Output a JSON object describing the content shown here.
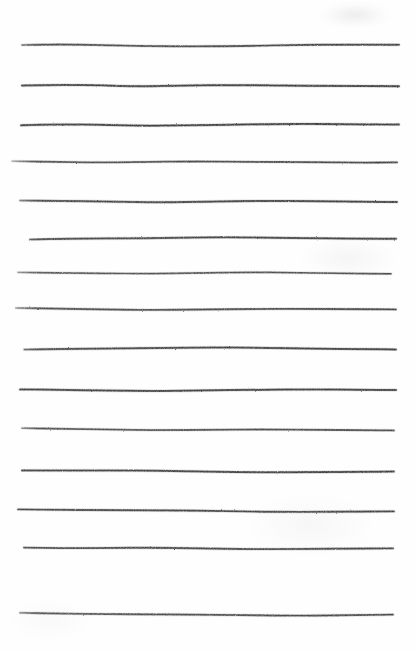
{
  "document": {
    "kind": "scanned-ruled-paper",
    "width": 417,
    "height": 650,
    "background_color": "#fefefe",
    "ink_color": "#3c3c3c",
    "ink_color_light": "#6b6b6b",
    "line_count": 15,
    "text_content": ""
  },
  "chart_data": {
    "type": "line",
    "title": "",
    "subtitle": "",
    "xlabel": "",
    "ylabel": "",
    "grid": false,
    "legend": null,
    "xlim": [
      0,
      417
    ],
    "ylim": [
      0,
      650
    ],
    "series": [
      {
        "name": "rule-1",
        "y": 45,
        "x_start": 22,
        "x_end": 399,
        "stroke_width": 1.9,
        "opacity": 0.92,
        "fade_start": true,
        "points": [
          [
            22,
            45
          ],
          [
            60,
            44.4
          ],
          [
            100,
            45.0
          ],
          [
            150,
            46.2
          ],
          [
            200,
            46.4
          ],
          [
            250,
            46.0
          ],
          [
            300,
            44.8
          ],
          [
            350,
            44.6
          ],
          [
            399,
            44.8
          ]
        ]
      },
      {
        "name": "rule-2",
        "y": 85,
        "x_start": 22,
        "x_end": 399,
        "stroke_width": 2.0,
        "opacity": 0.95,
        "fade_start": false,
        "points": [
          [
            22,
            85.6
          ],
          [
            60,
            84.8
          ],
          [
            100,
            85.4
          ],
          [
            140,
            86.4
          ],
          [
            180,
            85.6
          ],
          [
            230,
            85.0
          ],
          [
            280,
            85.6
          ],
          [
            330,
            86.0
          ],
          [
            399,
            86.2
          ]
        ]
      },
      {
        "name": "rule-3",
        "y": 124,
        "x_start": 21,
        "x_end": 399,
        "stroke_width": 2.0,
        "opacity": 0.95,
        "fade_start": false,
        "points": [
          [
            21,
            125.2
          ],
          [
            60,
            124.4
          ],
          [
            100,
            124.8
          ],
          [
            140,
            125.8
          ],
          [
            190,
            125.4
          ],
          [
            240,
            124.6
          ],
          [
            290,
            123.8
          ],
          [
            340,
            124.2
          ],
          [
            399,
            124.6
          ]
        ]
      },
      {
        "name": "rule-4",
        "y": 162,
        "x_start": 12,
        "x_end": 397,
        "stroke_width": 1.8,
        "opacity": 0.9,
        "fade_start": true,
        "points": [
          [
            12,
            161.2
          ],
          [
            50,
            161.8
          ],
          [
            95,
            162.6
          ],
          [
            140,
            162.0
          ],
          [
            190,
            161.4
          ],
          [
            250,
            161.8
          ],
          [
            310,
            162.2
          ],
          [
            360,
            162.6
          ],
          [
            397,
            162.4
          ]
        ]
      },
      {
        "name": "rule-5",
        "y": 201,
        "x_start": 20,
        "x_end": 397,
        "stroke_width": 2.0,
        "opacity": 0.94,
        "fade_start": true,
        "points": [
          [
            20,
            200.6
          ],
          [
            60,
            200.8
          ],
          [
            110,
            201.6
          ],
          [
            160,
            202.4
          ],
          [
            210,
            201.6
          ],
          [
            260,
            200.8
          ],
          [
            320,
            201.2
          ],
          [
            370,
            201.8
          ],
          [
            397,
            202.0
          ]
        ]
      },
      {
        "name": "rule-6",
        "y": 239,
        "x_start": 30,
        "x_end": 396,
        "stroke_width": 2.0,
        "opacity": 0.93,
        "fade_start": true,
        "points": [
          [
            30,
            239.6
          ],
          [
            70,
            238.6
          ],
          [
            120,
            238.4
          ],
          [
            170,
            238.0
          ],
          [
            220,
            237.2
          ],
          [
            265,
            237.6
          ],
          [
            320,
            238.4
          ],
          [
            370,
            238.8
          ],
          [
            396,
            238.8
          ]
        ]
      },
      {
        "name": "rule-7",
        "y": 272,
        "x_start": 18,
        "x_end": 391,
        "stroke_width": 1.7,
        "opacity": 0.86,
        "fade_start": true,
        "points": [
          [
            18,
            272.4
          ],
          [
            55,
            272.8
          ],
          [
            100,
            273.4
          ],
          [
            150,
            273.6
          ],
          [
            200,
            273.0
          ],
          [
            245,
            272.2
          ],
          [
            290,
            272.6
          ],
          [
            340,
            273.4
          ],
          [
            391,
            273.8
          ]
        ]
      },
      {
        "name": "rule-8",
        "y": 309,
        "x_start": 16,
        "x_end": 396,
        "stroke_width": 1.9,
        "opacity": 0.9,
        "fade_start": true,
        "points": [
          [
            16,
            308.0
          ],
          [
            55,
            308.6
          ],
          [
            100,
            309.4
          ],
          [
            150,
            310.0
          ],
          [
            200,
            309.6
          ],
          [
            250,
            309.0
          ],
          [
            300,
            308.8
          ],
          [
            350,
            309.2
          ],
          [
            396,
            309.4
          ]
        ]
      },
      {
        "name": "rule-9",
        "y": 349,
        "x_start": 24,
        "x_end": 396,
        "stroke_width": 2.0,
        "opacity": 0.94,
        "fade_start": true,
        "points": [
          [
            24,
            349.6
          ],
          [
            65,
            348.8
          ],
          [
            110,
            348.6
          ],
          [
            160,
            348.0
          ],
          [
            210,
            347.4
          ],
          [
            260,
            347.8
          ],
          [
            315,
            348.6
          ],
          [
            365,
            349.2
          ],
          [
            396,
            349.4
          ]
        ]
      },
      {
        "name": "rule-10",
        "y": 390,
        "x_start": 20,
        "x_end": 396,
        "stroke_width": 2.0,
        "opacity": 0.94,
        "fade_start": false,
        "points": [
          [
            20,
            389.4
          ],
          [
            60,
            389.8
          ],
          [
            105,
            390.6
          ],
          [
            155,
            391.0
          ],
          [
            205,
            390.4
          ],
          [
            255,
            389.8
          ],
          [
            310,
            389.4
          ],
          [
            360,
            389.8
          ],
          [
            396,
            390.0
          ]
        ]
      },
      {
        "name": "rule-11",
        "y": 429,
        "x_start": 22,
        "x_end": 394,
        "stroke_width": 1.8,
        "opacity": 0.88,
        "fade_start": true,
        "points": [
          [
            22,
            428.2
          ],
          [
            60,
            428.8
          ],
          [
            110,
            429.6
          ],
          [
            160,
            430.2
          ],
          [
            210,
            429.8
          ],
          [
            260,
            429.4
          ],
          [
            315,
            429.8
          ],
          [
            365,
            430.2
          ],
          [
            394,
            430.4
          ]
        ]
      },
      {
        "name": "rule-12",
        "y": 471,
        "x_start": 22,
        "x_end": 394,
        "stroke_width": 2.0,
        "opacity": 0.93,
        "fade_start": false,
        "points": [
          [
            22,
            470.4
          ],
          [
            65,
            470.6
          ],
          [
            110,
            470.4
          ],
          [
            160,
            470.8
          ],
          [
            210,
            471.8
          ],
          [
            260,
            472.4
          ],
          [
            310,
            472.2
          ],
          [
            360,
            471.8
          ],
          [
            394,
            471.6
          ]
        ]
      },
      {
        "name": "rule-13",
        "y": 510,
        "x_start": 18,
        "x_end": 394,
        "stroke_width": 1.9,
        "opacity": 0.92,
        "fade_start": false,
        "points": [
          [
            18,
            509.4
          ],
          [
            60,
            509.8
          ],
          [
            110,
            510.2
          ],
          [
            160,
            510.4
          ],
          [
            200,
            510.6
          ],
          [
            250,
            511.6
          ],
          [
            300,
            512.0
          ],
          [
            350,
            511.6
          ],
          [
            394,
            511.4
          ]
        ]
      },
      {
        "name": "rule-14",
        "y": 548,
        "x_start": 24,
        "x_end": 393,
        "stroke_width": 1.9,
        "opacity": 0.9,
        "fade_start": false,
        "points": [
          [
            24,
            547.6
          ],
          [
            65,
            548.2
          ],
          [
            110,
            548.0
          ],
          [
            150,
            547.6
          ],
          [
            200,
            548.4
          ],
          [
            250,
            549.2
          ],
          [
            300,
            549.0
          ],
          [
            350,
            548.6
          ],
          [
            393,
            548.4
          ]
        ]
      },
      {
        "name": "rule-15",
        "y": 614,
        "x_start": 20,
        "x_end": 393,
        "stroke_width": 1.9,
        "opacity": 0.88,
        "fade_start": true,
        "points": [
          [
            20,
            612.8
          ],
          [
            60,
            613.6
          ],
          [
            110,
            614.2
          ],
          [
            150,
            614.4
          ],
          [
            195,
            614.6
          ],
          [
            245,
            615.2
          ],
          [
            300,
            615.8
          ],
          [
            350,
            615.2
          ],
          [
            393,
            614.6
          ]
        ]
      }
    ]
  }
}
